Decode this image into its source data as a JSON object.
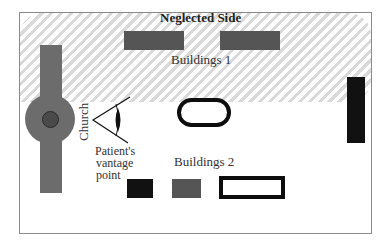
{
  "diagram": {
    "title": "Neglected Side",
    "labels": {
      "buildings_1": "Buildings 1",
      "buildings_2": "Buildings 2",
      "church": "Church",
      "vantage_line1": "Patient's",
      "vantage_line2": "vantage",
      "vantage_line3": "point"
    },
    "regions": [
      {
        "name": "neglected-side",
        "style": "hatched",
        "color": "#d9d9d9"
      }
    ],
    "objects": {
      "buildings_1": [
        {
          "shape": "rect",
          "fill": "#555555"
        },
        {
          "shape": "rect",
          "fill": "#555555"
        }
      ],
      "buildings_2": [
        {
          "shape": "rect",
          "fill": "#111111"
        },
        {
          "shape": "rect",
          "fill": "#555555"
        },
        {
          "shape": "rect-outline",
          "stroke": "#0d0d0d"
        }
      ],
      "church": {
        "shape": "cross-with-dome",
        "fill": "#6c6c6c"
      },
      "central_object": {
        "shape": "rounded-outline",
        "stroke": "#0d0d0d"
      },
      "right_building": {
        "shape": "rect",
        "fill": "#111111"
      },
      "eye": {
        "icon": "eye-icon",
        "meaning": "patient vantage point"
      }
    }
  }
}
